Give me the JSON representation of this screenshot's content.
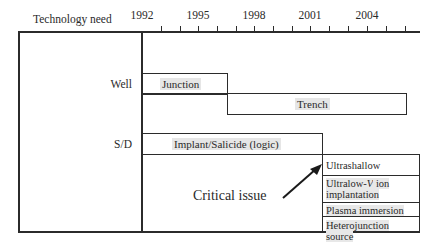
{
  "header": {
    "column_label": "Technology need",
    "years": [
      "1992",
      "1995",
      "1998",
      "2001",
      "2004"
    ]
  },
  "rows": {
    "well": {
      "label": "Well",
      "bars": [
        {
          "label": "Junction",
          "start": 1992,
          "end": 1996.5
        },
        {
          "label": "Trench",
          "start": 1996.5,
          "end": 2005.8
        }
      ]
    },
    "sd": {
      "label": "S/D",
      "bars": [
        {
          "label": "Implant/Salicide (logic)",
          "start": 1992,
          "end": 2001.6
        }
      ],
      "future_options": [
        "Ultrashallow",
        "Ultralow-V ion implantation",
        "Plasma immersion",
        "Heterojunction source"
      ],
      "future_option_parts": {
        "ultralow_prefix": "Ultralow-",
        "ultralow_italic": "V",
        "ultralow_suffix": " ion",
        "ultralow_line2": "implantation"
      }
    }
  },
  "annotation": {
    "label": "Critical issue",
    "arrow_target": "Ultrashallow"
  },
  "axis": {
    "start_year": 1992,
    "end_year": 2006,
    "tick_every": 1,
    "label_every": 3
  }
}
